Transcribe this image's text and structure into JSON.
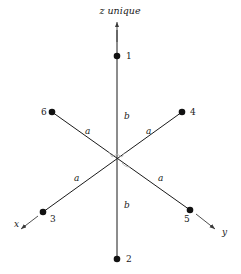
{
  "figure": {
    "title": "z unique",
    "axes": [
      {
        "id": "z",
        "label": "z unique",
        "direction": "up"
      },
      {
        "id": "x",
        "label": "x",
        "direction": "lower-left"
      },
      {
        "id": "y",
        "label": "y",
        "direction": "lower-right"
      }
    ],
    "vertices": [
      {
        "id": "1",
        "label": "1",
        "x": 117,
        "y": 56,
        "label_x": 126,
        "label_y": 59
      },
      {
        "id": "2",
        "label": "2",
        "x": 117,
        "y": 259,
        "label_x": 126,
        "label_y": 262
      },
      {
        "id": "3",
        "label": "3",
        "x": 43,
        "y": 212,
        "label_x": 50,
        "label_y": 222
      },
      {
        "id": "4",
        "label": "4",
        "x": 182,
        "y": 112,
        "label_x": 190,
        "label_y": 115
      },
      {
        "id": "5",
        "label": "5",
        "x": 190,
        "y": 210,
        "label_x": 184,
        "label_y": 222
      },
      {
        "id": "6",
        "label": "6",
        "x": 52,
        "y": 112,
        "label_x": 41,
        "label_y": 115
      }
    ],
    "bond_labels": [
      {
        "id": "b-upper",
        "text": "b",
        "x": 124,
        "y": 119
      },
      {
        "id": "b-lower",
        "text": "b",
        "x": 124,
        "y": 208
      },
      {
        "id": "a-upper-left",
        "text": "a",
        "x": 85,
        "y": 134
      },
      {
        "id": "a-upper-right",
        "text": "a",
        "x": 146,
        "y": 134
      },
      {
        "id": "a-lower-left",
        "text": "a",
        "x": 74,
        "y": 181
      },
      {
        "id": "a-lower-right",
        "text": "a",
        "x": 158,
        "y": 181
      }
    ],
    "axis_labels": [
      {
        "id": "x-axis-label",
        "text": "x",
        "x": 14,
        "y": 227
      },
      {
        "id": "y-axis-label",
        "text": "y",
        "x": 222,
        "y": 235
      }
    ],
    "origin": {
      "x": 117,
      "y": 162
    },
    "colors": {
      "line": "#1a1a1a",
      "vertex": "#111111",
      "arrow": "#3a3a3a",
      "background": "#ffffff",
      "faint": "#b9b9b9"
    }
  }
}
